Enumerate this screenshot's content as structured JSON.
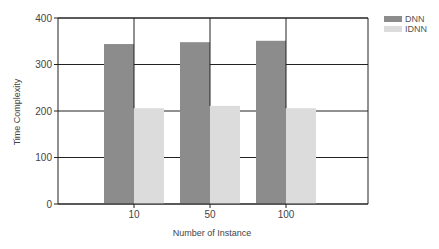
{
  "chart_data": {
    "type": "bar",
    "title": "",
    "xlabel": "Number of Instance",
    "ylabel": "Time Complexity",
    "categories": [
      "10",
      "50",
      "100"
    ],
    "series": [
      {
        "name": "DNN",
        "values": [
          344,
          348,
          351
        ],
        "color": "#8c8c8c"
      },
      {
        "name": "IDNN",
        "values": [
          206,
          211,
          206
        ],
        "color": "#dcdcdc"
      }
    ],
    "ylim": [
      0,
      400
    ],
    "yticks": [
      0,
      100,
      200,
      300,
      400
    ],
    "grid": true,
    "legend_position": "top-right"
  }
}
